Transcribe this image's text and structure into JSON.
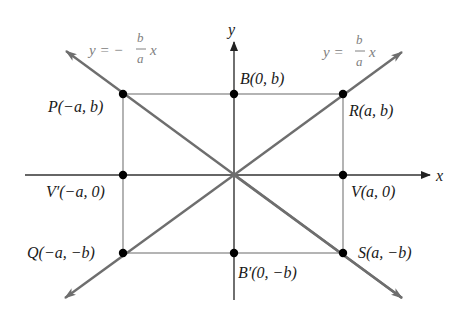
{
  "figure": {
    "axes": {
      "x_label": "x",
      "y_label": "y"
    },
    "points": [
      {
        "id": "P",
        "label": "P(−a, b)"
      },
      {
        "id": "B",
        "label": "B(0, b)"
      },
      {
        "id": "R",
        "label": "R(a, b)"
      },
      {
        "id": "Vp",
        "label": "V′(−a, 0)"
      },
      {
        "id": "V",
        "label": "V(a, 0)"
      },
      {
        "id": "Q",
        "label": "Q(−a, −b)"
      },
      {
        "id": "Bp",
        "label": "B′(0, −b)"
      },
      {
        "id": "S",
        "label": "S(a, −b)"
      }
    ],
    "asymptotes": [
      {
        "id": "neg",
        "prefix": "y = −",
        "num": "b",
        "den": "a",
        "suffix": "x"
      },
      {
        "id": "pos",
        "prefix": "y =",
        "num": "b",
        "den": "a",
        "suffix": "x"
      }
    ],
    "colors": {
      "axis": "#333333",
      "asymptote": "#6e6e6e",
      "rectangle": "#8c8c8c",
      "point": "#000000",
      "asymptote_label": "#808080"
    }
  }
}
